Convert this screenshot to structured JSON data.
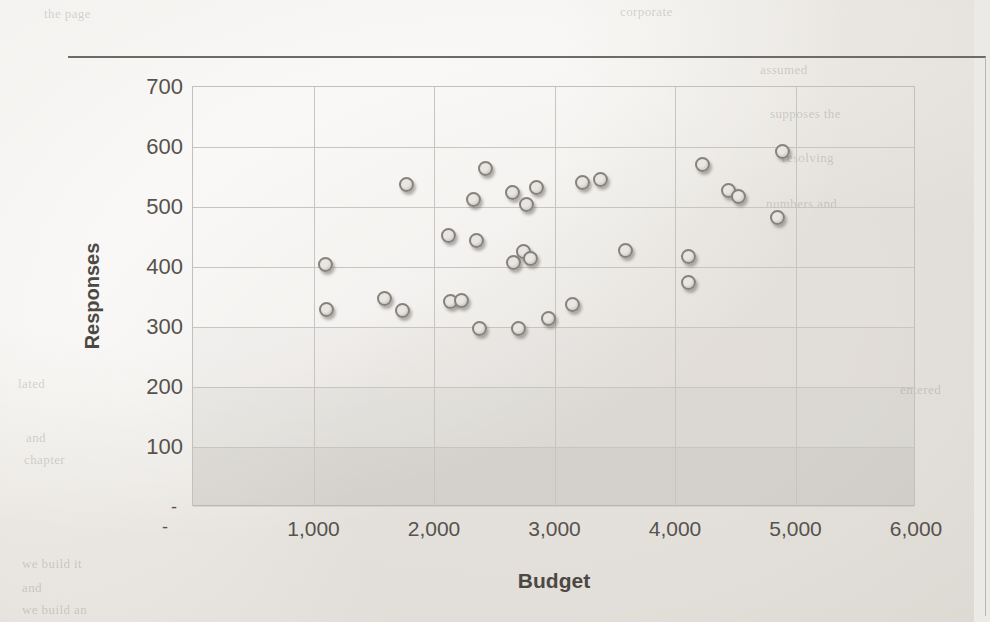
{
  "chart_data": {
    "type": "scatter",
    "title": "",
    "xlabel": "Budget",
    "ylabel": "Responses",
    "xlim": [
      0,
      6000
    ],
    "ylim": [
      0,
      700
    ],
    "grid": true,
    "legend": "none",
    "x_tick_labels": [
      "-",
      "1,000",
      "2,000",
      "3,000",
      "4,000",
      "5,000",
      "6,000"
    ],
    "x_tick_values": [
      0,
      1000,
      2000,
      3000,
      4000,
      5000,
      6000
    ],
    "y_tick_labels": [
      "-",
      "100",
      "200",
      "300",
      "400",
      "500",
      "600",
      "700"
    ],
    "y_tick_values": [
      0,
      100,
      200,
      300,
      400,
      500,
      600,
      700
    ],
    "series": [
      {
        "name": "Budget vs Responses",
        "marker": "circle",
        "marker_color": "#dcd9d4",
        "marker_edge_color": "#86817c",
        "points": [
          {
            "x": 1100,
            "y": 405
          },
          {
            "x": 1110,
            "y": 329
          },
          {
            "x": 1590,
            "y": 348
          },
          {
            "x": 1740,
            "y": 327
          },
          {
            "x": 1770,
            "y": 537
          },
          {
            "x": 2120,
            "y": 453
          },
          {
            "x": 2140,
            "y": 342
          },
          {
            "x": 2230,
            "y": 345
          },
          {
            "x": 2330,
            "y": 513
          },
          {
            "x": 2350,
            "y": 445
          },
          {
            "x": 2380,
            "y": 297
          },
          {
            "x": 2430,
            "y": 564
          },
          {
            "x": 2650,
            "y": 524
          },
          {
            "x": 2660,
            "y": 407
          },
          {
            "x": 2700,
            "y": 298
          },
          {
            "x": 2740,
            "y": 426
          },
          {
            "x": 2770,
            "y": 504
          },
          {
            "x": 2800,
            "y": 415
          },
          {
            "x": 2850,
            "y": 533
          },
          {
            "x": 2950,
            "y": 314
          },
          {
            "x": 3150,
            "y": 337
          },
          {
            "x": 3230,
            "y": 541
          },
          {
            "x": 3380,
            "y": 546
          },
          {
            "x": 3590,
            "y": 427
          },
          {
            "x": 4110,
            "y": 418
          },
          {
            "x": 4110,
            "y": 375
          },
          {
            "x": 4230,
            "y": 571
          },
          {
            "x": 4440,
            "y": 527
          },
          {
            "x": 4530,
            "y": 518
          },
          {
            "x": 4850,
            "y": 483
          },
          {
            "x": 4890,
            "y": 592
          }
        ]
      }
    ]
  },
  "ghost_text": [
    {
      "text": "the page",
      "x": 44,
      "y": 6
    },
    {
      "text": "corporate",
      "x": 620,
      "y": 4
    },
    {
      "text": "assumed",
      "x": 760,
      "y": 62
    },
    {
      "text": "supposes the",
      "x": 770,
      "y": 106
    },
    {
      "text": "resolving",
      "x": 782,
      "y": 150
    },
    {
      "text": "numbers and",
      "x": 766,
      "y": 196
    },
    {
      "text": "entered",
      "x": 900,
      "y": 382
    },
    {
      "text": "lated",
      "x": 18,
      "y": 376
    },
    {
      "text": "and",
      "x": 26,
      "y": 430
    },
    {
      "text": "chapter",
      "x": 24,
      "y": 452
    },
    {
      "text": "we build it",
      "x": 22,
      "y": 556
    },
    {
      "text": "and",
      "x": 22,
      "y": 580
    },
    {
      "text": "we build an",
      "x": 22,
      "y": 602
    }
  ]
}
